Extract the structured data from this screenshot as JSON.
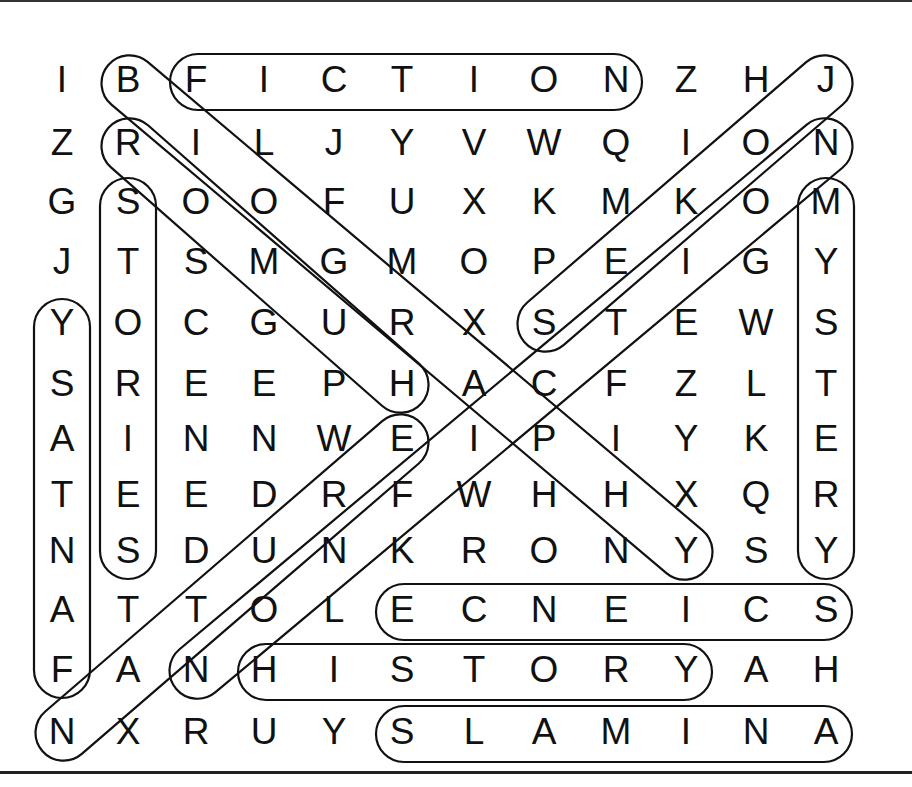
{
  "puzzle": {
    "type": "word-search",
    "rows": 12,
    "cols": 12,
    "grid": [
      [
        "I",
        "B",
        "F",
        "I",
        "C",
        "T",
        "I",
        "O",
        "N",
        "Z",
        "H",
        "J"
      ],
      [
        "Z",
        "R",
        "I",
        "L",
        "J",
        "Y",
        "V",
        "W",
        "Q",
        "I",
        "O",
        "N"
      ],
      [
        "G",
        "S",
        "O",
        "O",
        "F",
        "U",
        "X",
        "K",
        "M",
        "K",
        "O",
        "M"
      ],
      [
        "J",
        "T",
        "S",
        "M",
        "G",
        "M",
        "O",
        "P",
        "E",
        "I",
        "G",
        "Y"
      ],
      [
        "Y",
        "O",
        "C",
        "G",
        "U",
        "R",
        "X",
        "S",
        "T",
        "E",
        "W",
        "S"
      ],
      [
        "S",
        "R",
        "E",
        "E",
        "P",
        "H",
        "A",
        "C",
        "F",
        "Z",
        "L",
        "T"
      ],
      [
        "A",
        "I",
        "N",
        "N",
        "W",
        "E",
        "I",
        "P",
        "I",
        "Y",
        "K",
        "E"
      ],
      [
        "T",
        "E",
        "E",
        "D",
        "R",
        "F",
        "W",
        "H",
        "H",
        "X",
        "Q",
        "R"
      ],
      [
        "N",
        "S",
        "D",
        "U",
        "N",
        "K",
        "R",
        "O",
        "N",
        "Y",
        "S",
        "Y"
      ],
      [
        "A",
        "T",
        "T",
        "O",
        "L",
        "E",
        "C",
        "N",
        "E",
        "I",
        "C",
        "S"
      ],
      [
        "F",
        "A",
        "N",
        "H",
        "I",
        "S",
        "T",
        "O",
        "R",
        "Y",
        "A",
        "H"
      ],
      [
        "N",
        "X",
        "R",
        "U",
        "Y",
        "S",
        "L",
        "A",
        "M",
        "I",
        "N",
        "A"
      ]
    ],
    "found_words": [
      {
        "word": "FICTION",
        "start": [
          0,
          2
        ],
        "end": [
          0,
          8
        ]
      },
      {
        "word": "SCIENCE",
        "start": [
          9,
          11
        ],
        "end": [
          9,
          5
        ]
      },
      {
        "word": "HISTORY",
        "start": [
          10,
          3
        ],
        "end": [
          10,
          9
        ]
      },
      {
        "word": "ANIMALS",
        "start": [
          11,
          11
        ],
        "end": [
          11,
          5
        ]
      },
      {
        "word": "STORIES",
        "start": [
          2,
          1
        ],
        "end": [
          8,
          1
        ]
      },
      {
        "word": "FANTASY",
        "start": [
          10,
          0
        ],
        "end": [
          4,
          0
        ]
      },
      {
        "word": "MYSTERY",
        "start": [
          2,
          11
        ],
        "end": [
          8,
          11
        ]
      },
      {
        "word": "BIOGRAPHY",
        "start": [
          0,
          1
        ],
        "end": [
          8,
          9
        ]
      },
      {
        "word": "HUMOR",
        "start": [
          5,
          5
        ],
        "end": [
          1,
          1
        ]
      },
      {
        "word": "JOKES",
        "start": [
          0,
          11
        ],
        "end": [
          4,
          7
        ]
      },
      {
        "word": "NATURE",
        "start": [
          11,
          0
        ],
        "end": [
          6,
          5
        ]
      },
      {
        "word": "NONFICTION",
        "start": [
          10,
          2
        ],
        "end": [
          1,
          11
        ]
      }
    ]
  }
}
